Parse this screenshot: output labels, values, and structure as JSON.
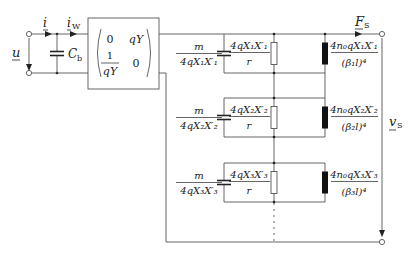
{
  "diagram": {
    "input": {
      "voltage_label": "u",
      "current_label": "i",
      "current_w_label": "i",
      "current_w_sub": "W",
      "capacitor_label": "C",
      "capacitor_sub": "b"
    },
    "matrix": {
      "r1c1": "0",
      "r1c2": "qY",
      "r2c1_num": "1",
      "r2c1_den": "qY",
      "r2c2": "0"
    },
    "output": {
      "force_label": "F",
      "force_sub": "S",
      "velocity_label": "v",
      "velocity_sub": "S"
    },
    "branches": [
      {
        "mass_num": "m",
        "mass_den": "4qX₁X′₁",
        "res_num": "4qX₁X′₁",
        "res_den": "r",
        "ind_num": "4n₀qX₁X′₁",
        "ind_den": "(β₁l)⁴"
      },
      {
        "mass_num": "m",
        "mass_den": "4qX₂X′₂",
        "res_num": "4qX₂X′₂",
        "res_den": "r",
        "ind_num": "4n₀qX₂X′₂",
        "ind_den": "(β₂l)⁴"
      },
      {
        "mass_num": "m",
        "mass_den": "4qX₃X′₃",
        "res_num": "4qX₃X′₃",
        "res_den": "r",
        "ind_num": "4n₀qX₃X′₃",
        "ind_den": "(β₃l)⁴"
      }
    ],
    "continuation": "⋮"
  }
}
